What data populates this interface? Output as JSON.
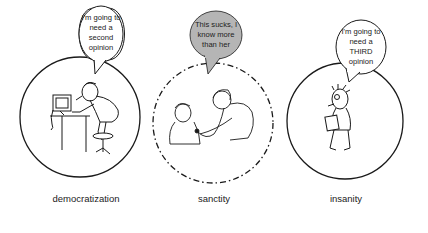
{
  "panels": [
    {
      "id": "democratization",
      "label": "democratization",
      "bubble_lines": [
        "I'm going to",
        "need a",
        "second",
        "opinion"
      ],
      "bubble_fill": "#ffffff",
      "circle_style": "solid",
      "illustration": "person-at-computer"
    },
    {
      "id": "sanctity",
      "label": "sanctity",
      "bubble_lines": [
        "This sucks, I",
        "know more",
        "than her"
      ],
      "bubble_fill": "#b5b5b5",
      "circle_style": "dash-dot",
      "illustration": "doctor-with-stethoscope-and-patient"
    },
    {
      "id": "insanity",
      "label": "insanity",
      "bubble_lines": [
        "I'm going to",
        "need a",
        "THIRD",
        "opinion"
      ],
      "bubble_fill": "#ffffff",
      "circle_style": "solid",
      "illustration": "anxious-person-reading-paper"
    }
  ],
  "colors": {
    "stroke": "#1a1a1a",
    "text": "#222222",
    "gray_bubble": "#b5b5b5"
  }
}
